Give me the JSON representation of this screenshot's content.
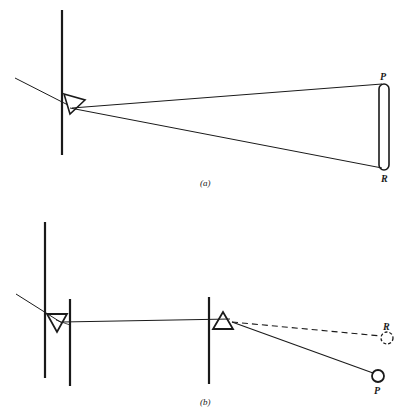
{
  "figure": {
    "panels": [
      {
        "id": "a",
        "caption": "(a)",
        "labels": {
          "top": "P",
          "bottom": "R"
        },
        "description": "Light ray enters prism at a slit; dispersed spectrum spreads from P to R on a screen"
      },
      {
        "id": "b",
        "caption": "(b)",
        "labels": {
          "dashed_target": "R",
          "solid_target": "P"
        },
        "description": "Light passes first prism and slits, then second inverted prism recombines/deviates; dashed path to R, solid path to P"
      }
    ],
    "colors": {
      "ink": "#1a1a1a",
      "background": "#ffffff"
    }
  }
}
